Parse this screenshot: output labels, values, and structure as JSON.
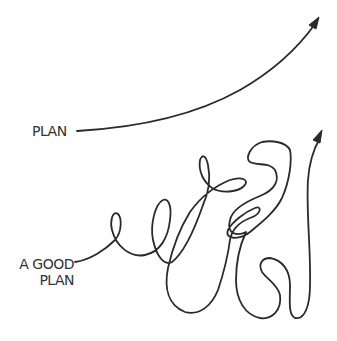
{
  "diagram": {
    "style": "hand-drawn line comic",
    "stroke_color": "#2a2a2a",
    "background": "#ffffff",
    "labels": {
      "plan": "PLAN",
      "good_plan_line1": "A GOOD",
      "good_plan_line2": "PLAN"
    },
    "paths": [
      {
        "name": "plan-path",
        "description": "smooth upward curve ending in arrow",
        "arrow": true
      },
      {
        "name": "good-plan-path",
        "description": "meandering squiggly line with many loops ending in upward arrow",
        "arrow": true
      }
    ]
  }
}
